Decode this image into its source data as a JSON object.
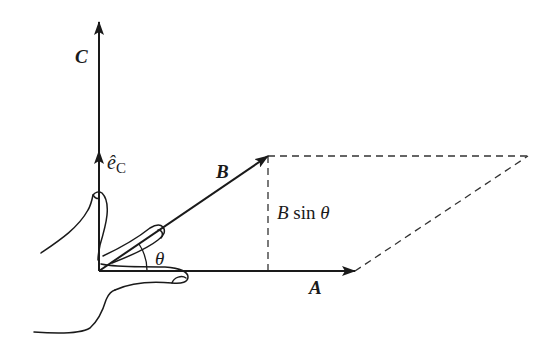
{
  "figure": {
    "labels": {
      "vector_a": "A",
      "vector_b": "B",
      "vector_c": "C",
      "unit_vector_c_base": "ê",
      "unit_vector_c_sub": "C",
      "angle": "θ",
      "height_prefix": "B",
      "height_func": "sin",
      "height_angle": "θ"
    },
    "geometry": {
      "origin": [
        99,
        271
      ],
      "a_tip": [
        355,
        271
      ],
      "b_tip": [
        268,
        156
      ],
      "c_tip": [
        99,
        22
      ],
      "unit_c_tip": [
        99,
        155
      ],
      "parallelogram_far_corner": [
        528,
        156
      ]
    },
    "colors": {
      "ink": "#1a1a1a",
      "background": "#ffffff"
    }
  }
}
